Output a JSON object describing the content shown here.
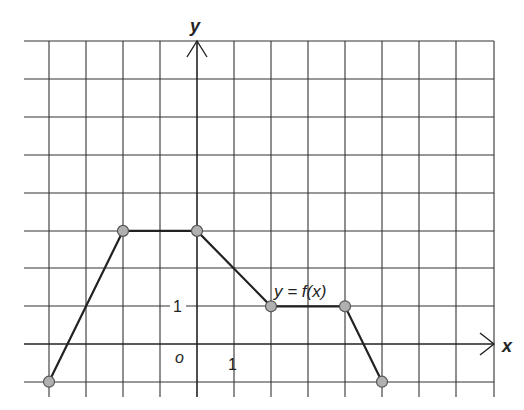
{
  "figure": {
    "function_label": "y = f(x)",
    "x_axis_label": "x",
    "y_axis_label": "y",
    "origin_label": "o",
    "x_tick_label": "1",
    "y_tick_label": "1"
  },
  "chart_data": {
    "type": "line",
    "title": "",
    "xlabel": "x",
    "ylabel": "y",
    "grid": true,
    "xlim": [
      -4.7,
      8
    ],
    "ylim": [
      -1.4,
      8
    ],
    "series": [
      {
        "name": "y = f(x)",
        "x": [
          -4,
          -2,
          0,
          2,
          4,
          5
        ],
        "y": [
          -1,
          3,
          3,
          1,
          1,
          -1
        ]
      }
    ],
    "annotations": [
      "y = f(x)",
      "o",
      "1",
      "1"
    ]
  },
  "colors": {
    "grid": "#333333",
    "line": "#222222",
    "point_fill": "#b0b0b0",
    "point_stroke": "#555555"
  }
}
